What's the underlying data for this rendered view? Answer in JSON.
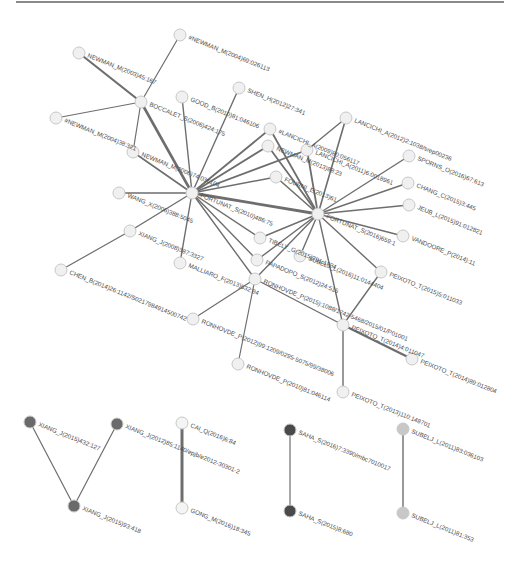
{
  "figure": {
    "type": "citation-network",
    "top_rule": true
  },
  "colors": {
    "edge": "#6e6e6e",
    "node_default": "#f0f0f0",
    "node_stroke": "#c8c8c8",
    "cluster_xiang": "#6a6a6a",
    "cluster_saha": "#4a4a4a",
    "cluster_subelj": "#c8c8c8",
    "cluster_cai": "#f4f4f4",
    "label": "#4a4a4a"
  },
  "nodes": [
    {
      "id": "n_newman_2004_69",
      "label": "#NEWMAN_M(2004)69:026113",
      "x": 180,
      "y": 35,
      "fill": "#f0f0f0"
    },
    {
      "id": "n_newman_2003",
      "label": "NEWMAN_M(2003)45:167",
      "x": 79,
      "y": 53,
      "fill": "#f0f0f0"
    },
    {
      "id": "n_boccalet",
      "label": "BOCCALET_S(2006)424:175",
      "x": 141,
      "y": 102,
      "fill": "#f0f0f0"
    },
    {
      "id": "n_good",
      "label": "GOOD_B(2010)81:046106",
      "x": 182,
      "y": 97,
      "fill": "#f0f0f0"
    },
    {
      "id": "n_shen",
      "label": "SHEN_H(2012)27:341",
      "x": 239,
      "y": 88,
      "fill": "#f0f0f0"
    },
    {
      "id": "n_newman_2004_38",
      "label": "#NEWMAN_M(2004)38:321",
      "x": 56,
      "y": 118,
      "fill": "#f0f0f0"
    },
    {
      "id": "n_newman_m_hub",
      "label": "NEWMAN_M(2006)74:036104",
      "x": 133,
      "y": 152,
      "fill": "#f0f0f0"
    },
    {
      "id": "n_lancichi_2009",
      "label": "#LANCICHI_A(2009)80:056117",
      "x": 270,
      "y": 129,
      "fill": "#f0f0f0"
    },
    {
      "id": "n_lancichi_2012",
      "label": "LANCICHI_A(2012)2:1038/srep00236",
      "x": 346,
      "y": 118,
      "fill": "#f0f0f0"
    },
    {
      "id": "n_newman_2013",
      "label": "NEWMAN_M(2013)88:23",
      "x": 268,
      "y": 146,
      "fill": "#f0f0f0"
    },
    {
      "id": "n_lancichi_2011",
      "label": "LANCICHI_A(2011)6:0018961",
      "x": 307,
      "y": 150,
      "fill": "#f0f0f0"
    },
    {
      "id": "n_spoms",
      "label": "SPORNS_O(2016)67:613",
      "x": 409,
      "y": 156,
      "fill": "#f0f0f0"
    },
    {
      "id": "n_fortunat_hub1",
      "label": "FORTUNAT_S(2010)486:75",
      "x": 192,
      "y": 193,
      "fill": "#f0f0f0"
    },
    {
      "id": "n_fourni",
      "label": "FOURNI_E(2013)61",
      "x": 276,
      "y": 177,
      "fill": "#f0f0f0"
    },
    {
      "id": "n_chang",
      "label": "CHANG_C(2015)3:445",
      "x": 408,
      "y": 183,
      "fill": "#f0f0f0"
    },
    {
      "id": "n_wang",
      "label": "WANG_X(2006)388:5045",
      "x": 119,
      "y": 193,
      "fill": "#f0f0f0"
    },
    {
      "id": "n_jeub",
      "label": "JEUB_L(2015)91:012821",
      "x": 409,
      "y": 205,
      "fill": "#f0f0f0"
    },
    {
      "id": "n_fortunat_hub2",
      "label": "FORTUNAT_S(2016)659:1",
      "x": 318,
      "y": 214,
      "fill": "#f0f0f0"
    },
    {
      "id": "n_xiang_2008",
      "label": "XIANG_J(2008)387:3327",
      "x": 130,
      "y": 231,
      "fill": "#f0f0f0"
    },
    {
      "id": "n_tibely",
      "label": "TIBELY_G(2015)391:1834",
      "x": 260,
      "y": 238,
      "fill": "#f0f0f0"
    },
    {
      "id": "n_vandoore",
      "label": "VANDOORE_P(2014):11",
      "x": 403,
      "y": 236,
      "fill": "#f0f0f0"
    },
    {
      "id": "n_malliaro",
      "label": "MALLIARO_F(2013)532:94",
      "x": 180,
      "y": 263,
      "fill": "#f0f0f0"
    },
    {
      "id": "n_papadopo",
      "label": "PAPADOPO_S(2012)24:515",
      "x": 257,
      "y": 260,
      "fill": "#f0f0f0"
    },
    {
      "id": "n_subelj_2016",
      "label": "SUBELJ_L(2016)11:0144404",
      "x": 300,
      "y": 256,
      "fill": "#f0f0f0"
    },
    {
      "id": "n_chen",
      "label": "CHEN_B(2014)26:1142/S0217984914500742",
      "x": 61,
      "y": 270,
      "fill": "#f0f0f0"
    },
    {
      "id": "n_ronhovde_mid",
      "label": "RONHOVDE_P(2015):1088/1742-5468/2015/01/P01001",
      "x": 255,
      "y": 279,
      "fill": "#f0f0f0"
    },
    {
      "id": "n_peixoto_2015",
      "label": "PEIXOTO_T(2015)5:011033",
      "x": 381,
      "y": 272,
      "fill": "#f0f0f0"
    },
    {
      "id": "n_peixoto_2014_4",
      "label": "PEIXOTO_T(2014)4:011047",
      "x": 343,
      "y": 325,
      "fill": "#f0f0f0"
    },
    {
      "id": "n_ronhovde_2012",
      "label": "RONHOVDE_P(2012)99:1209/0295-5075/99/38006",
      "x": 193,
      "y": 319,
      "fill": "#f0f0f0"
    },
    {
      "id": "n_ronhovde_2010",
      "label": "RONHOVDE_P(2010)81:046114",
      "x": 238,
      "y": 364,
      "fill": "#f0f0f0"
    },
    {
      "id": "n_peixoto_2014_89",
      "label": "PEIXOTO_T(2014)89:012804",
      "x": 412,
      "y": 359,
      "fill": "#f0f0f0"
    },
    {
      "id": "n_peixoto_2013",
      "label": "PEIXOTO_T(2013)110:148701",
      "x": 343,
      "y": 392,
      "fill": "#f0f0f0"
    },
    {
      "id": "n_xiang_2015_432",
      "label": "XIANG_J(2015)432:127",
      "x": 30,
      "y": 422,
      "fill": "#6a6a6a"
    },
    {
      "id": "n_xiang_2012",
      "label": "XIANG_J(2012)85:1140/epjb/e2012-30301-2",
      "x": 117,
      "y": 424,
      "fill": "#6a6a6a"
    },
    {
      "id": "n_xiang_2015_93",
      "label": "XIANG_J(2015)93:418",
      "x": 74,
      "y": 506,
      "fill": "#6a6a6a"
    },
    {
      "id": "n_cai",
      "label": "CAI_Q(2016)6:84",
      "x": 182,
      "y": 423,
      "fill": "#f4f4f4"
    },
    {
      "id": "n_gong",
      "label": "GONG_M(2016)18:345",
      "x": 182,
      "y": 508,
      "fill": "#f4f4f4"
    },
    {
      "id": "n_saha_2016",
      "label": "SAHA_S(2016)7:3390/mbc7010017",
      "x": 290,
      "y": 430,
      "fill": "#4a4a4a"
    },
    {
      "id": "n_saha_2015",
      "label": "SAHA_S(2015)8:680",
      "x": 290,
      "y": 511,
      "fill": "#4a4a4a"
    },
    {
      "id": "n_subelj_2011_83",
      "label": "SUBELJ_L(2011)83:036103",
      "x": 403,
      "y": 429,
      "fill": "#c8c8c8"
    },
    {
      "id": "n_subelj_2011_81",
      "label": "SUBELJ_L(2011)81:353",
      "x": 403,
      "y": 513,
      "fill": "#c8c8c8"
    }
  ],
  "edges": [
    {
      "s": "n_boccalet",
      "t": "n_newman_2004_69",
      "w": 1.2
    },
    {
      "s": "n_boccalet",
      "t": "n_newman_2003",
      "w": 2.2
    },
    {
      "s": "n_boccalet",
      "t": "n_newman_2004_38",
      "w": 1.2
    },
    {
      "s": "n_boccalet",
      "t": "n_newman_m_hub",
      "w": 1.2
    },
    {
      "s": "n_boccalet",
      "t": "n_fortunat_hub1",
      "w": 2.6
    },
    {
      "s": "n_good",
      "t": "n_fortunat_hub1",
      "w": 1.4
    },
    {
      "s": "n_shen",
      "t": "n_fortunat_hub1",
      "w": 1.4
    },
    {
      "s": "n_newman_m_hub",
      "t": "n_fortunat_hub1",
      "w": 1.6
    },
    {
      "s": "n_wang",
      "t": "n_fortunat_hub1",
      "w": 1.4
    },
    {
      "s": "n_xiang_2008",
      "t": "n_fortunat_hub1",
      "w": 1.4
    },
    {
      "s": "n_xiang_2008",
      "t": "n_chen",
      "w": 1.2
    },
    {
      "s": "n_malliaro",
      "t": "n_fortunat_hub1",
      "w": 1.4
    },
    {
      "s": "n_lancichi_2009",
      "t": "n_fortunat_hub1",
      "w": 1.8
    },
    {
      "s": "n_lancichi_2009",
      "t": "n_fortunat_hub2",
      "w": 1.8
    },
    {
      "s": "n_newman_2013",
      "t": "n_fortunat_hub1",
      "w": 1.8
    },
    {
      "s": "n_newman_2013",
      "t": "n_fortunat_hub2",
      "w": 1.8
    },
    {
      "s": "n_lancichi_2011",
      "t": "n_fortunat_hub1",
      "w": 1.8
    },
    {
      "s": "n_lancichi_2011",
      "t": "n_fortunat_hub2",
      "w": 1.8
    },
    {
      "s": "n_lancichi_2012",
      "t": "n_fortunat_hub2",
      "w": 1.6
    },
    {
      "s": "n_lancichi_2012",
      "t": "n_lancichi_2011",
      "w": 1.4
    },
    {
      "s": "n_fourni",
      "t": "n_fortunat_hub1",
      "w": 1.6
    },
    {
      "s": "n_fourni",
      "t": "n_fortunat_hub2",
      "w": 1.6
    },
    {
      "s": "n_fortunat_hub1",
      "t": "n_fortunat_hub2",
      "w": 2.8
    },
    {
      "s": "n_fortunat_hub1",
      "t": "n_tibely",
      "w": 1.4
    },
    {
      "s": "n_fortunat_hub1",
      "t": "n_papadopo",
      "w": 1.4
    },
    {
      "s": "n_fortunat_hub1",
      "t": "n_ronhovde_mid",
      "w": 1.4
    },
    {
      "s": "n_tibely",
      "t": "n_fortunat_hub2",
      "w": 1.4
    },
    {
      "s": "n_papadopo",
      "t": "n_fortunat_hub2",
      "w": 1.4
    },
    {
      "s": "n_subelj_2016",
      "t": "n_fortunat_hub2",
      "w": 1.4
    },
    {
      "s": "n_ronhovde_mid",
      "t": "n_fortunat_hub2",
      "w": 1.4
    },
    {
      "s": "n_spoms",
      "t": "n_fortunat_hub2",
      "w": 1.4
    },
    {
      "s": "n_chang",
      "t": "n_fortunat_hub2",
      "w": 1.4
    },
    {
      "s": "n_jeub",
      "t": "n_fortunat_hub2",
      "w": 1.4
    },
    {
      "s": "n_vandoore",
      "t": "n_fortunat_hub2",
      "w": 1.4
    },
    {
      "s": "n_peixoto_2015",
      "t": "n_fortunat_hub2",
      "w": 1.4
    },
    {
      "s": "n_peixoto_2014_4",
      "t": "n_fortunat_hub2",
      "w": 1.4
    },
    {
      "s": "n_peixoto_2014_4",
      "t": "n_peixoto_2015",
      "w": 1.4
    },
    {
      "s": "n_ronhovde_mid",
      "t": "n_peixoto_2014_4",
      "w": 1.4
    },
    {
      "s": "n_ronhovde_mid",
      "t": "n_ronhovde_2012",
      "w": 1.2
    },
    {
      "s": "n_ronhovde_mid",
      "t": "n_ronhovde_2010",
      "w": 1.2
    },
    {
      "s": "n_peixoto_2014_4",
      "t": "n_peixoto_2014_89",
      "w": 2.4
    },
    {
      "s": "n_peixoto_2014_4",
      "t": "n_peixoto_2013",
      "w": 1.4
    },
    {
      "s": "n_xiang_2015_432",
      "t": "n_xiang_2015_93",
      "w": 1.2
    },
    {
      "s": "n_xiang_2012",
      "t": "n_xiang_2015_93",
      "w": 1.2
    },
    {
      "s": "n_cai",
      "t": "n_gong",
      "w": 3.0
    },
    {
      "s": "n_saha_2016",
      "t": "n_saha_2015",
      "w": 1.2
    },
    {
      "s": "n_subelj_2011_83",
      "t": "n_subelj_2011_81",
      "w": 1.4
    }
  ]
}
